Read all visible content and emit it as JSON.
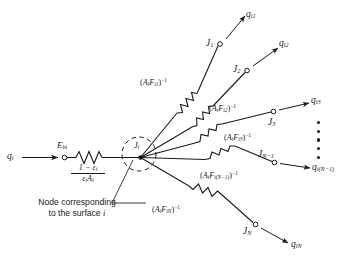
{
  "diagram": {
    "colors": {
      "line": "#1a1a1a",
      "text": "#1a1a1a",
      "background": "#ffffff"
    },
    "source_node": {
      "input_flux": "q",
      "input_flux_sub": "i",
      "potential": "E",
      "potential_sub": "bi",
      "surface_resistance_numerator": "1 − ε",
      "surface_resistance_numerator_sub": "i",
      "surface_resistance_denominator": "ε",
      "surface_resistance_denominator_sub": "i",
      "surface_resistance_denominator_2": "A",
      "surface_resistance_denominator_2_sub": "i"
    },
    "center_node": {
      "label": "J",
      "label_sub": "i",
      "annotation_line1": "Node corresponding",
      "annotation_line2_prefix": "to the surface ",
      "annotation_line2_italic": "i"
    },
    "branches": [
      {
        "node_label": "J",
        "node_sub": "1",
        "flux_label": "q",
        "flux_sub": "i1",
        "resistance_open": "(",
        "resistance_A": "A",
        "resistance_A_sub": "i",
        "resistance_F": "F",
        "resistance_F_sub": "i1",
        "resistance_close": ")",
        "resistance_exp": "−1"
      },
      {
        "node_label": "J",
        "node_sub": "2",
        "flux_label": "q",
        "flux_sub": "i2",
        "resistance_open": "(",
        "resistance_A": "A",
        "resistance_A_sub": "i",
        "resistance_F": "F",
        "resistance_F_sub": "i2",
        "resistance_close": ")",
        "resistance_exp": "−1"
      },
      {
        "node_label": "J",
        "node_sub": "3",
        "flux_label": "q",
        "flux_sub": "i3",
        "resistance_open": "(",
        "resistance_A": "A",
        "resistance_A_sub": "i",
        "resistance_F": "F",
        "resistance_F_sub": "i3",
        "resistance_close": ")",
        "resistance_exp": "−1"
      },
      {
        "node_label": "J",
        "node_sub": "N−1",
        "flux_label": "q",
        "flux_sub": "i(N−1)",
        "resistance_open": "(",
        "resistance_A": "A",
        "resistance_A_sub": "i",
        "resistance_F": "F",
        "resistance_F_sub": "i(N−1)",
        "resistance_close": ")",
        "resistance_exp": "−1"
      },
      {
        "node_label": "J",
        "node_sub": "N",
        "flux_label": "q",
        "flux_sub": "iN",
        "resistance_open": "(",
        "resistance_A": "A",
        "resistance_A_sub": "i",
        "resistance_F": "F",
        "resistance_F_sub": "iN",
        "resistance_close": ")",
        "resistance_exp": "−1"
      }
    ],
    "ellipsis_dot_count": 5
  }
}
